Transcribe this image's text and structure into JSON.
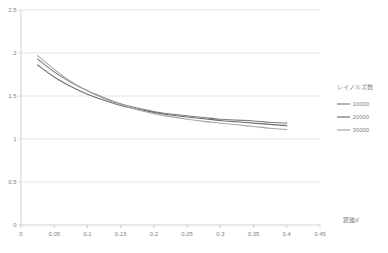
{
  "chart_data": {
    "type": "line",
    "title": "",
    "xlabel": "距離d'",
    "ylabel": "",
    "xlim": [
      0,
      0.45
    ],
    "ylim": [
      0,
      2.5
    ],
    "grid": true,
    "legend_position": "right",
    "legend_title": "レイノルズ数",
    "x_ticks": [
      "0",
      "0.05",
      "0.1",
      "0.15",
      "0.2",
      "0.25",
      "0.3",
      "0.35",
      "0.4",
      "0.45"
    ],
    "x_tick_values": [
      0,
      0.05,
      0.1,
      0.15,
      0.2,
      0.25,
      0.3,
      0.35,
      0.4,
      0.45
    ],
    "y_ticks": [
      "0",
      "0.5",
      "1",
      "1.5",
      "2",
      "2.5"
    ],
    "y_tick_values": [
      0,
      0.5,
      1,
      1.5,
      2,
      2.5
    ],
    "x": [
      0.025,
      0.05,
      0.075,
      0.1,
      0.125,
      0.15,
      0.175,
      0.2,
      0.225,
      0.25,
      0.275,
      0.3,
      0.325,
      0.35,
      0.375,
      0.4
    ],
    "series": [
      {
        "name": "10000",
        "color": "#808080",
        "values": [
          1.93,
          1.78,
          1.66,
          1.56,
          1.48,
          1.41,
          1.36,
          1.32,
          1.29,
          1.27,
          1.25,
          1.23,
          1.22,
          1.21,
          1.195,
          1.185
        ]
      },
      {
        "name": "20000",
        "color": "#6e6e6e",
        "values": [
          1.86,
          1.72,
          1.61,
          1.52,
          1.45,
          1.39,
          1.345,
          1.31,
          1.28,
          1.255,
          1.235,
          1.215,
          1.2,
          1.185,
          1.17,
          1.155
        ]
      },
      {
        "name": "30000",
        "color": "#a6a6a6",
        "values": [
          1.97,
          1.81,
          1.67,
          1.56,
          1.47,
          1.4,
          1.34,
          1.295,
          1.26,
          1.23,
          1.205,
          1.185,
          1.165,
          1.145,
          1.125,
          1.11
        ]
      }
    ]
  },
  "axis": {
    "x_title": "距離d'",
    "y_title": ""
  },
  "legend": {
    "title": "レイノルズ数",
    "entries": [
      {
        "label": "10000"
      },
      {
        "label": "20000"
      },
      {
        "label": "30000"
      }
    ]
  }
}
